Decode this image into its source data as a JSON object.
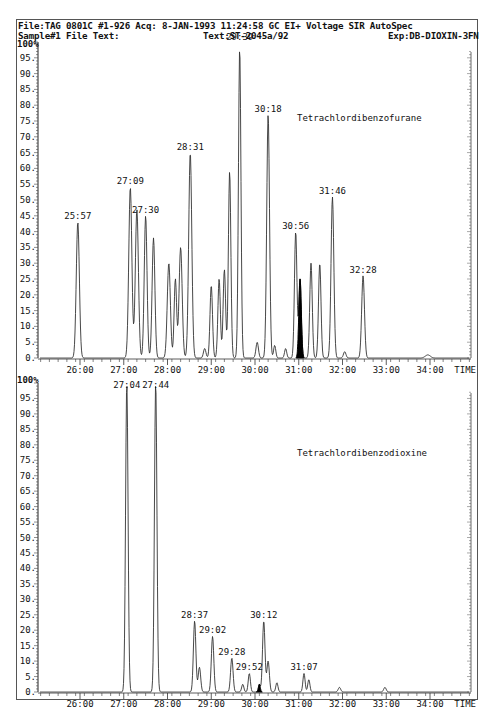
{
  "header": {
    "line1": "File:TAG 0801C #1-926 Acq: 8-JAN-1993 11:24:58 GC EI+ Voltage SIR AutoSpec",
    "sample": "Sample#1 File Text:",
    "text": "Text:ST-2045a/92",
    "exp": "Exp:DB-DIOXIN-3FN"
  },
  "chart_data": [
    {
      "type": "line",
      "title": "Tetrachlordibenzofurane",
      "xlabel": "TIME",
      "ylabel": "%",
      "xlim": [
        "25:00",
        "35:00"
      ],
      "ylim": [
        0,
        100
      ],
      "x_ticks": [
        "26:00",
        "27:00",
        "28:00",
        "29:00",
        "30:00",
        "31:00",
        "32:00",
        "33:00",
        "34:00"
      ],
      "y_ticks": [
        0,
        5,
        10,
        15,
        20,
        25,
        30,
        35,
        40,
        45,
        50,
        55,
        60,
        65,
        70,
        75,
        80,
        85,
        90,
        95,
        100
      ],
      "y_top_label": "100%",
      "peaks": [
        {
          "t": 25.95,
          "h": 43,
          "w": 0.05,
          "label": "25:57"
        },
        {
          "t": 27.15,
          "h": 54,
          "w": 0.05,
          "label": "27:09"
        },
        {
          "t": 27.3,
          "h": 47,
          "w": 0.05,
          "label": ""
        },
        {
          "t": 27.5,
          "h": 45,
          "w": 0.045,
          "label": "27:30"
        },
        {
          "t": 27.68,
          "h": 38,
          "w": 0.045,
          "label": ""
        },
        {
          "t": 28.03,
          "h": 30,
          "w": 0.05,
          "label": ""
        },
        {
          "t": 28.18,
          "h": 25,
          "w": 0.04,
          "label": ""
        },
        {
          "t": 28.3,
          "h": 35,
          "w": 0.05,
          "label": ""
        },
        {
          "t": 28.52,
          "h": 65,
          "w": 0.05,
          "label": "28:31"
        },
        {
          "t": 28.85,
          "h": 3,
          "w": 0.04,
          "label": ""
        },
        {
          "t": 29.0,
          "h": 23,
          "w": 0.04,
          "label": ""
        },
        {
          "t": 29.18,
          "h": 25,
          "w": 0.04,
          "label": ""
        },
        {
          "t": 29.3,
          "h": 28,
          "w": 0.04,
          "label": ""
        },
        {
          "t": 29.42,
          "h": 59,
          "w": 0.04,
          "label": ""
        },
        {
          "t": 29.65,
          "h": 98,
          "w": 0.04,
          "label": "29:39"
        },
        {
          "t": 30.05,
          "h": 5,
          "w": 0.04,
          "label": ""
        },
        {
          "t": 30.3,
          "h": 77,
          "w": 0.045,
          "label": "30:18"
        },
        {
          "t": 30.45,
          "h": 4,
          "w": 0.035,
          "label": ""
        },
        {
          "t": 30.7,
          "h": 3,
          "w": 0.035,
          "label": ""
        },
        {
          "t": 30.93,
          "h": 40,
          "w": 0.04,
          "label": "30:56"
        },
        {
          "t": 31.03,
          "h": 25,
          "w": 0.04,
          "label": "",
          "filled": true
        },
        {
          "t": 31.28,
          "h": 30,
          "w": 0.04,
          "label": ""
        },
        {
          "t": 31.48,
          "h": 30,
          "w": 0.04,
          "label": ""
        },
        {
          "t": 31.77,
          "h": 51,
          "w": 0.045,
          "label": "31:46"
        },
        {
          "t": 32.05,
          "h": 2,
          "w": 0.04,
          "label": ""
        },
        {
          "t": 32.47,
          "h": 26,
          "w": 0.045,
          "label": "32:28"
        },
        {
          "t": 33.95,
          "h": 1,
          "w": 0.08,
          "label": ""
        }
      ]
    },
    {
      "type": "line",
      "title": "Tetrachlordibenzodioxine",
      "xlabel": "TIME",
      "ylabel": "%",
      "xlim": [
        "25:00",
        "35:00"
      ],
      "ylim": [
        0,
        100
      ],
      "x_ticks": [
        "26:00",
        "27:00",
        "28:00",
        "29:00",
        "30:00",
        "31:00",
        "32:00",
        "33:00",
        "34:00"
      ],
      "y_ticks": [
        0,
        5,
        10,
        15,
        20,
        25,
        30,
        35,
        40,
        45,
        50,
        55,
        60,
        65,
        70,
        75,
        80,
        85,
        90,
        95,
        100
      ],
      "y_top_label": "100%",
      "peaks": [
        {
          "t": 27.07,
          "h": 100,
          "w": 0.04,
          "label": "27:04"
        },
        {
          "t": 27.73,
          "h": 100,
          "w": 0.04,
          "label": "27:44"
        },
        {
          "t": 28.62,
          "h": 23,
          "w": 0.04,
          "label": "28:37"
        },
        {
          "t": 28.73,
          "h": 8,
          "w": 0.04,
          "label": ""
        },
        {
          "t": 29.03,
          "h": 18,
          "w": 0.04,
          "label": "29:02"
        },
        {
          "t": 29.47,
          "h": 11,
          "w": 0.04,
          "label": "29:28"
        },
        {
          "t": 29.72,
          "h": 2.5,
          "w": 0.035,
          "label": ""
        },
        {
          "t": 29.87,
          "h": 6,
          "w": 0.035,
          "label": "29:52"
        },
        {
          "t": 30.1,
          "h": 2.5,
          "w": 0.03,
          "label": "",
          "filled": true
        },
        {
          "t": 30.2,
          "h": 23,
          "w": 0.04,
          "label": "30:12"
        },
        {
          "t": 30.3,
          "h": 10,
          "w": 0.04,
          "label": ""
        },
        {
          "t": 30.5,
          "h": 3,
          "w": 0.035,
          "label": ""
        },
        {
          "t": 31.12,
          "h": 6,
          "w": 0.035,
          "label": "31:07"
        },
        {
          "t": 31.23,
          "h": 4,
          "w": 0.035,
          "label": ""
        },
        {
          "t": 31.93,
          "h": 1.5,
          "w": 0.04,
          "label": ""
        },
        {
          "t": 32.97,
          "h": 1.5,
          "w": 0.04,
          "label": ""
        }
      ]
    }
  ]
}
